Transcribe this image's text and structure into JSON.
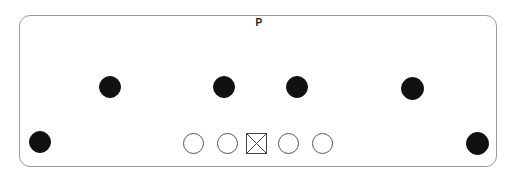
{
  "diagram": {
    "title": "P",
    "panel": {
      "x": 19,
      "y": 15,
      "width": 478,
      "height": 152,
      "corner_radius": 11,
      "border_color": "#9b9b9b",
      "fill_color": "#ffffff"
    },
    "colors": {
      "filled_node": "#111111",
      "open_node_stroke": "#555555",
      "crossbox_stroke": "#444444",
      "label_text": "#1a1a1a"
    },
    "nodes": [
      {
        "id": "node-top-1",
        "shape": "filled-circle",
        "cx": 110,
        "cy": 87,
        "d": 22,
        "row": "top"
      },
      {
        "id": "node-top-2",
        "shape": "filled-circle",
        "cx": 224,
        "cy": 87,
        "d": 22,
        "row": "top"
      },
      {
        "id": "node-top-3",
        "shape": "filled-circle",
        "cx": 297,
        "cy": 87,
        "d": 22,
        "row": "top"
      },
      {
        "id": "node-top-4",
        "shape": "filled-circle",
        "cx": 412,
        "cy": 88,
        "d": 23,
        "row": "top"
      },
      {
        "id": "node-corner-left",
        "shape": "filled-circle",
        "cx": 40,
        "cy": 142,
        "d": 22,
        "row": "bottom"
      },
      {
        "id": "node-corner-right",
        "shape": "filled-circle",
        "cx": 477,
        "cy": 143,
        "d": 23,
        "row": "bottom"
      },
      {
        "id": "node-bottom-1",
        "shape": "open-circle",
        "cx": 193,
        "cy": 143,
        "d": 21,
        "row": "bottom"
      },
      {
        "id": "node-bottom-2",
        "shape": "open-circle",
        "cx": 227,
        "cy": 143,
        "d": 21,
        "row": "bottom"
      },
      {
        "id": "node-bottom-3",
        "shape": "crossed-square",
        "cx": 256,
        "cy": 143,
        "d": 21,
        "row": "bottom"
      },
      {
        "id": "node-bottom-4",
        "shape": "open-circle",
        "cx": 288,
        "cy": 143,
        "d": 21,
        "row": "bottom"
      },
      {
        "id": "node-bottom-5",
        "shape": "open-circle",
        "cx": 322,
        "cy": 143,
        "d": 21,
        "row": "bottom"
      }
    ]
  }
}
